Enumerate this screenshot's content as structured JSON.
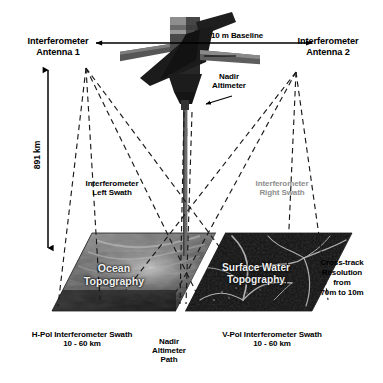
{
  "figure": {
    "type": "diagram"
  },
  "labels": {
    "antenna_left": "Interferometer\nAntenna 1",
    "antenna_right": "Interferometer\nAntenna 2",
    "baseline": "10 m Baseline",
    "nadir_altimeter": "Nadir\nAltimeter",
    "altitude": "891 km",
    "swath_left": "Interferometer\nLeft Swath",
    "swath_right": "Interferometer\nRight Swath",
    "cross_track": "Cross-track\nResolution\nfrom\n70m to 10m"
  },
  "panels": [
    {
      "name": "ocean-topography-panel",
      "caption": "Ocean\nTopography"
    },
    {
      "name": "surface-water-topography-panel",
      "caption": "Surface Water\nTopography"
    }
  ],
  "footnotes": {
    "left": "H-Pol Interferometer Swath\n10 - 60 km",
    "center": "Nadir\nAltimeter\nPath",
    "right": "V-Pol Interferometer Swath\n10 - 60 km"
  },
  "colors": {
    "background": "#ffffff",
    "ink": "#000000",
    "muted_ink": "#8d8d8d",
    "panel_light": "#f0f0f0",
    "satellite_dark": "#2a2a2a"
  }
}
